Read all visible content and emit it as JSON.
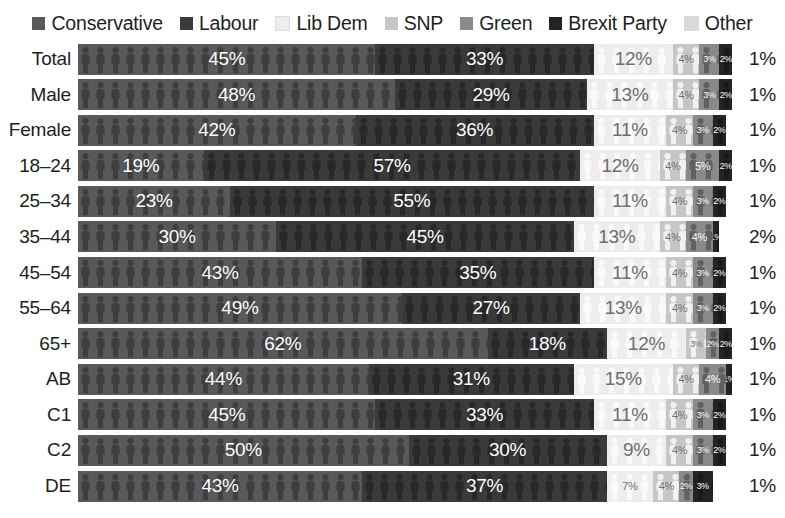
{
  "chart_data": {
    "type": "bar",
    "subtype": "stacked-horizontal-pictogram",
    "title": "",
    "xlabel": "",
    "ylabel": "",
    "xlim": [
      0,
      100
    ],
    "grid": false,
    "legend_position": "top",
    "value_suffix": "%",
    "categories": [
      "Total",
      "Male",
      "Female",
      "18–24",
      "25–34",
      "35–44",
      "45–54",
      "55–64",
      "65+",
      "AB",
      "C1",
      "C2",
      "DE"
    ],
    "series": [
      {
        "name": "Conservative",
        "color": "#595959",
        "values": [
          45,
          48,
          42,
          19,
          23,
          30,
          43,
          49,
          62,
          44,
          45,
          50,
          43
        ]
      },
      {
        "name": "Labour",
        "color": "#3a3a3a",
        "values": [
          33,
          29,
          36,
          57,
          55,
          45,
          35,
          27,
          18,
          31,
          33,
          30,
          37
        ]
      },
      {
        "name": "Lib Dem",
        "color": "#ededed",
        "values": [
          12,
          13,
          11,
          12,
          11,
          13,
          11,
          13,
          12,
          15,
          11,
          9,
          7
        ]
      },
      {
        "name": "SNP",
        "color": "#c6c6c6",
        "values": [
          4,
          4,
          4,
          4,
          4,
          4,
          4,
          4,
          3,
          4,
          4,
          4,
          4
        ]
      },
      {
        "name": "Green",
        "color": "#8a8a8a",
        "values": [
          3,
          3,
          3,
          5,
          3,
          4,
          3,
          3,
          2,
          4,
          3,
          3,
          2
        ]
      },
      {
        "name": "Brexit Party",
        "color": "#242424",
        "values": [
          2,
          2,
          2,
          2,
          2,
          1,
          2,
          2,
          2,
          1,
          2,
          2,
          3
        ]
      },
      {
        "name": "Other",
        "color": "#d9d9d9",
        "values": [
          1,
          1,
          1,
          1,
          1,
          2,
          1,
          1,
          1,
          1,
          1,
          1,
          1
        ]
      }
    ],
    "rows": [
      {
        "label": "Total",
        "values": [
          45,
          33,
          12,
          4,
          3,
          2,
          1
        ],
        "display": [
          "45%",
          "33%",
          "12%",
          "4%",
          "3%",
          "2%",
          "1%"
        ]
      },
      {
        "label": "Male",
        "values": [
          48,
          29,
          13,
          4,
          3,
          2,
          1
        ],
        "display": [
          "48%",
          "29%",
          "13%",
          "4%",
          "3%",
          "2%",
          "1%"
        ]
      },
      {
        "label": "Female",
        "values": [
          42,
          36,
          11,
          4,
          3,
          2,
          1
        ],
        "display": [
          "42%",
          "36%",
          "11%",
          "4%",
          "3%",
          "2%",
          "1%"
        ]
      },
      {
        "label": "18–24",
        "values": [
          19,
          57,
          12,
          4,
          5,
          2,
          1
        ],
        "display": [
          "19%",
          "57%",
          "12%",
          "4%",
          "5%",
          "2%",
          "1%"
        ]
      },
      {
        "label": "25–34",
        "values": [
          23,
          55,
          11,
          4,
          3,
          2,
          1
        ],
        "display": [
          "23%",
          "55%",
          "11%",
          "4%",
          "3%",
          "2%",
          "1%"
        ]
      },
      {
        "label": "35–44",
        "values": [
          30,
          45,
          13,
          4,
          4,
          1,
          2
        ],
        "display": [
          "30%",
          "45%",
          "13%",
          "4%",
          "4%",
          "1%",
          "2%"
        ]
      },
      {
        "label": "45–54",
        "values": [
          43,
          35,
          11,
          4,
          3,
          2,
          1
        ],
        "display": [
          "43%",
          "35%",
          "11%",
          "4%",
          "3%",
          "2%",
          "1%"
        ]
      },
      {
        "label": "55–64",
        "values": [
          49,
          27,
          13,
          4,
          3,
          2,
          1
        ],
        "display": [
          "49%",
          "27%",
          "13%",
          "4%",
          "3%",
          "2%",
          "1%"
        ]
      },
      {
        "label": "65+",
        "values": [
          62,
          18,
          12,
          3,
          2,
          2,
          1
        ],
        "display": [
          "62%",
          "18%",
          "12%",
          "3%",
          "2%",
          "2%",
          "1%"
        ]
      },
      {
        "label": "AB",
        "values": [
          44,
          31,
          15,
          4,
          4,
          1,
          1
        ],
        "display": [
          "44%",
          "31%",
          "15%",
          "4%",
          "4%",
          "1%",
          "1%"
        ]
      },
      {
        "label": "C1",
        "values": [
          45,
          33,
          11,
          4,
          3,
          2,
          1
        ],
        "display": [
          "45%",
          "33%",
          "11%",
          "4%",
          "3%",
          "2%",
          "1%"
        ]
      },
      {
        "label": "C2",
        "values": [
          50,
          30,
          9,
          4,
          3,
          2,
          1
        ],
        "display": [
          "50%",
          "30%",
          "9%",
          "4%",
          "3%",
          "2%",
          "1%"
        ]
      },
      {
        "label": "DE",
        "values": [
          43,
          37,
          7,
          4,
          2,
          3,
          1
        ],
        "display": [
          "43%",
          "37%",
          "7%",
          "4%",
          "2%",
          "3%",
          "1%"
        ]
      }
    ]
  },
  "legend": {
    "items": [
      {
        "label": "Conservative",
        "color": "#595959",
        "icon": "legend-swatch-conservative"
      },
      {
        "label": "Labour",
        "color": "#3a3a3a",
        "icon": "legend-swatch-labour"
      },
      {
        "label": "Lib Dem",
        "color": "#ededed",
        "icon": "legend-swatch-libdem"
      },
      {
        "label": "SNP",
        "color": "#c6c6c6",
        "icon": "legend-swatch-snp"
      },
      {
        "label": "Green",
        "color": "#8a8a8a",
        "icon": "legend-swatch-green"
      },
      {
        "label": "Brexit Party",
        "color": "#242424",
        "icon": "legend-swatch-brexit"
      },
      {
        "label": "Other",
        "color": "#d9d9d9",
        "icon": "legend-swatch-other"
      }
    ]
  },
  "colors": {
    "conservative": "#595959",
    "labour": "#3a3a3a",
    "lib_dem": "#ededed",
    "snp": "#c6c6c6",
    "green": "#8a8a8a",
    "brexit_party": "#242424",
    "other": "#d9d9d9",
    "background": "#ffffff",
    "text": "#1e1e1e"
  }
}
